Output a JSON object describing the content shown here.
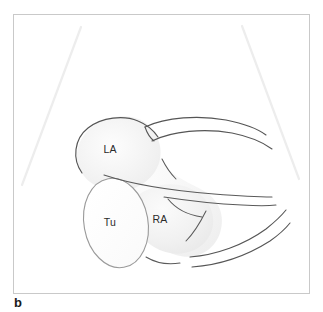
{
  "figure": {
    "panel_letter": "b",
    "type": "line-drawing-diagram",
    "modality": "echocardiography-schematic",
    "background_color": "#ffffff",
    "frame": {
      "border_color": "#c9c9c9",
      "x": 13,
      "y": 14,
      "width": 297,
      "height": 280
    },
    "labels": [
      {
        "id": "la",
        "text": "LA",
        "x": 108,
        "y": 134,
        "color": "#2b2b2b"
      },
      {
        "id": "tu",
        "text": "Tu",
        "x": 107,
        "y": 209,
        "color": "#2b2b2b"
      },
      {
        "id": "ra",
        "text": "RA",
        "x": 148,
        "y": 206,
        "color": "#2b2b2b"
      }
    ],
    "structures": {
      "la_chamber": {
        "name": "LA",
        "fill": "#f2f2f2",
        "stroke": "#555555"
      },
      "ra_chamber": {
        "name": "RA",
        "fill": "#f0f0f0",
        "stroke": "#666666"
      },
      "tu_mass": {
        "name": "Tu",
        "fill": "#fcfcfc",
        "stroke": "#9a9a9a"
      }
    },
    "beam_lines": {
      "stroke": "#ededed",
      "count": 2
    },
    "outline_stroke": "#4a4a4a"
  }
}
